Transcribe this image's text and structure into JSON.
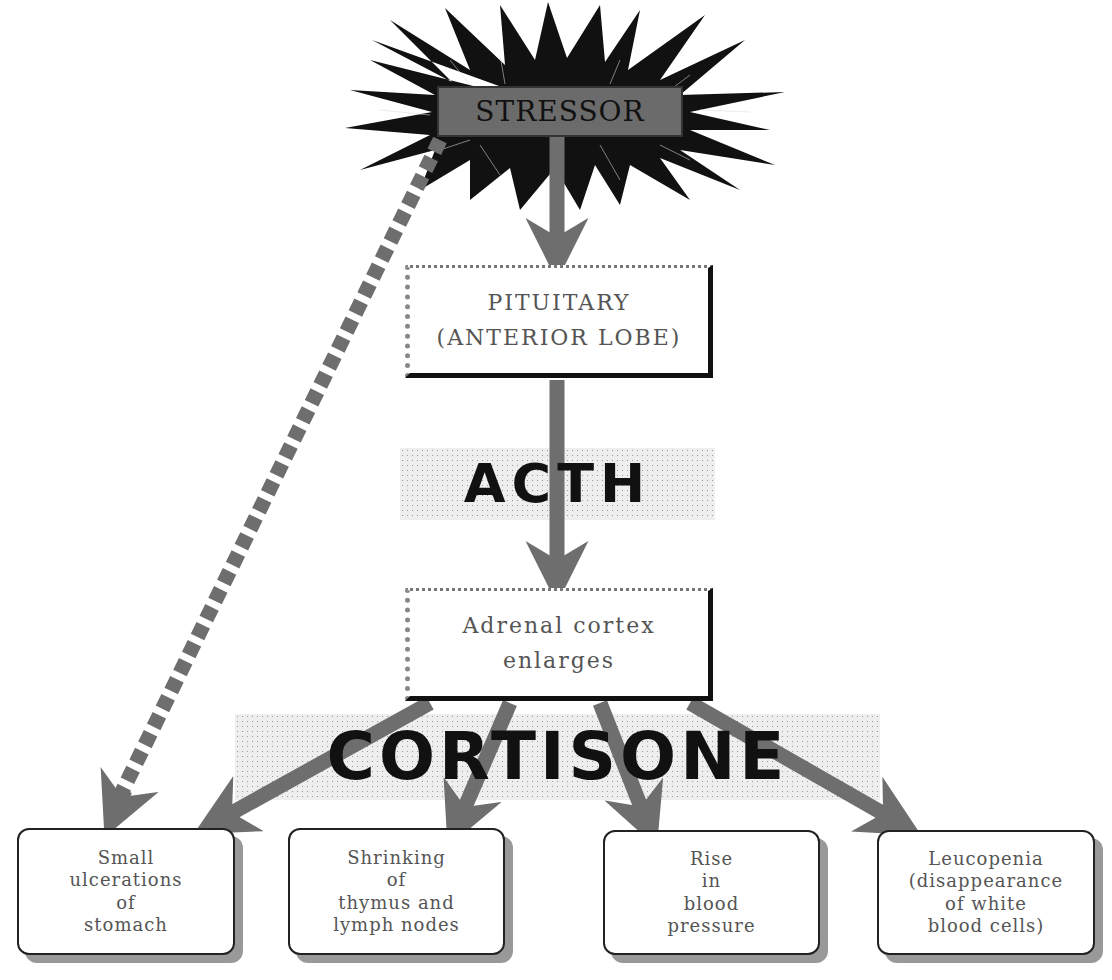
{
  "diagram": {
    "type": "flowchart",
    "colors": {
      "arrow": "#6e6e6e",
      "starburst": "#111111",
      "stressor_label_bg": "#6b6b6b",
      "box_border": "#111111",
      "text": "#555555",
      "band_stipple": "#999999"
    },
    "stressor": {
      "label": "STRESSOR",
      "icon": "starburst-icon"
    },
    "pituitary": {
      "line1": "PITUITARY",
      "line2": "(ANTERIOR LOBE)"
    },
    "acth": {
      "label": "ACTH"
    },
    "adrenal": {
      "line1": "Adrenal cortex",
      "line2": "enlarges"
    },
    "cortisone": {
      "label": "CORTISONE"
    },
    "effects": [
      {
        "lines": [
          "Small",
          "ulcerations",
          "of",
          "stomach"
        ]
      },
      {
        "lines": [
          "Shrinking",
          "of",
          "thymus and",
          "lymph nodes"
        ]
      },
      {
        "lines": [
          "Rise",
          "in",
          "blood",
          "pressure"
        ]
      },
      {
        "lines": [
          "Leucopenia",
          "(disappearance",
          "of white",
          "blood cells)"
        ]
      }
    ],
    "edges": [
      {
        "from": "STRESSOR",
        "to": "PITUITARY",
        "style": "solid"
      },
      {
        "from": "PITUITARY",
        "to": "Adrenal cortex",
        "style": "solid",
        "label": "ACTH"
      },
      {
        "from": "Adrenal cortex",
        "to": "Small ulcerations of stomach",
        "style": "solid",
        "label": "CORTISONE"
      },
      {
        "from": "Adrenal cortex",
        "to": "Shrinking of thymus and lymph nodes",
        "style": "solid",
        "label": "CORTISONE"
      },
      {
        "from": "Adrenal cortex",
        "to": "Rise in blood pressure",
        "style": "solid",
        "label": "CORTISONE"
      },
      {
        "from": "Adrenal cortex",
        "to": "Leucopenia",
        "style": "solid",
        "label": "CORTISONE"
      },
      {
        "from": "STRESSOR",
        "to": "Small ulcerations of stomach",
        "style": "dashed"
      }
    ]
  }
}
